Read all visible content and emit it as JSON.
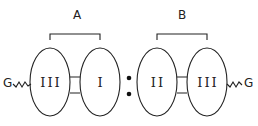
{
  "diagram": {
    "groups": [
      {
        "id": "A",
        "label": "A",
        "subunits": [
          "III",
          "I"
        ]
      },
      {
        "id": "B",
        "label": "B",
        "subunits": [
          "II",
          "III"
        ]
      }
    ],
    "left_terminal": "G",
    "right_terminal": "G",
    "separator": ":",
    "colors": {
      "line": "#222222",
      "background": "#ffffff"
    }
  }
}
